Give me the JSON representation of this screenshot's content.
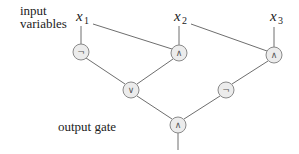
{
  "diagram": {
    "type": "boolean-circuit",
    "labels": {
      "inputs_line1": "input",
      "inputs_line2": "variables",
      "output": "output gate"
    },
    "variables": [
      {
        "id": "x1",
        "name": "x",
        "sub": "1"
      },
      {
        "id": "x2",
        "name": "x",
        "sub": "2"
      },
      {
        "id": "x3",
        "name": "x",
        "sub": "3"
      }
    ],
    "gates": [
      {
        "id": "g_not1",
        "op": "NOT",
        "symbol": "¬"
      },
      {
        "id": "g_and1",
        "op": "AND",
        "symbol": "∧"
      },
      {
        "id": "g_and2",
        "op": "AND",
        "symbol": "∧"
      },
      {
        "id": "g_or",
        "op": "OR",
        "symbol": "∨"
      },
      {
        "id": "g_not2",
        "op": "NOT",
        "symbol": "¬"
      },
      {
        "id": "g_out",
        "op": "AND",
        "symbol": "∧"
      }
    ],
    "edges": [
      {
        "from": "x1",
        "to": "g_not1"
      },
      {
        "from": "x1",
        "to": "g_and1"
      },
      {
        "from": "x2",
        "to": "g_and1"
      },
      {
        "from": "x2",
        "to": "g_and2"
      },
      {
        "from": "x3",
        "to": "g_and2"
      },
      {
        "from": "g_not1",
        "to": "g_or"
      },
      {
        "from": "g_and1",
        "to": "g_or"
      },
      {
        "from": "g_and2",
        "to": "g_not2"
      },
      {
        "from": "g_or",
        "to": "g_out"
      },
      {
        "from": "g_not2",
        "to": "g_out"
      }
    ],
    "colors": {
      "gate_fill": "#ececec",
      "gate_stroke": "#8a8a8a",
      "edge": "#6e6e6e",
      "text": "#222222"
    }
  }
}
